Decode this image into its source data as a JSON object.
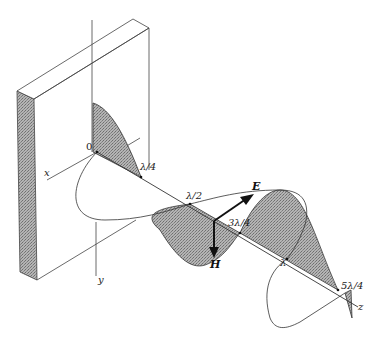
{
  "diagram": {
    "axes": {
      "x": "x",
      "y": "y",
      "z": "z",
      "origin": "0"
    },
    "nodes": [
      "λ/4",
      "λ/2",
      "3λ/4",
      "λ",
      "5λ/4"
    ],
    "vectors": {
      "electric": "E",
      "magnetic": "H"
    },
    "colors": {
      "line": "#333333",
      "shade": "#9a9a9a",
      "shade_dark": "#7d7d7d",
      "background": "#ffffff"
    }
  }
}
